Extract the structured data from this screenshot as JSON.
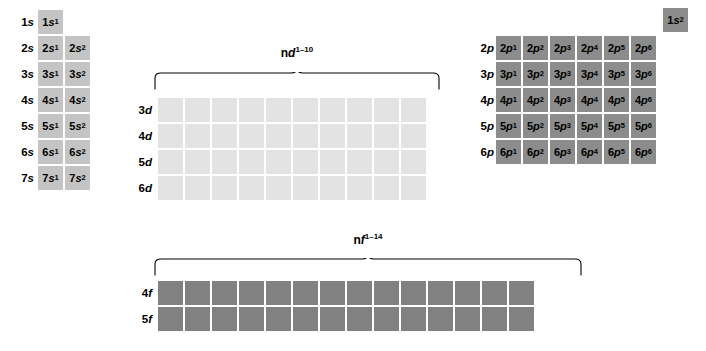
{
  "figure": {
    "colors": {
      "s_block": "#c3c4c3",
      "p_block": "#8b8c8b",
      "d_block": "#e2e3e2",
      "f_block": "#808180",
      "background": "#ffffff",
      "text": "#000000"
    }
  },
  "s_block": {
    "rows": [
      {
        "label_n": "1",
        "label_orbital": "s",
        "cells": [
          {
            "n": "1",
            "orbital": "s",
            "exp": "1"
          }
        ]
      },
      {
        "label_n": "2",
        "label_orbital": "s",
        "cells": [
          {
            "n": "2",
            "orbital": "s",
            "exp": "1"
          },
          {
            "n": "2",
            "orbital": "s",
            "exp": "2"
          }
        ]
      },
      {
        "label_n": "3",
        "label_orbital": "s",
        "cells": [
          {
            "n": "3",
            "orbital": "s",
            "exp": "1"
          },
          {
            "n": "3",
            "orbital": "s",
            "exp": "2"
          }
        ]
      },
      {
        "label_n": "4",
        "label_orbital": "s",
        "cells": [
          {
            "n": "4",
            "orbital": "s",
            "exp": "1"
          },
          {
            "n": "4",
            "orbital": "s",
            "exp": "2"
          }
        ]
      },
      {
        "label_n": "5",
        "label_orbital": "s",
        "cells": [
          {
            "n": "5",
            "orbital": "s",
            "exp": "1"
          },
          {
            "n": "5",
            "orbital": "s",
            "exp": "2"
          }
        ]
      },
      {
        "label_n": "6",
        "label_orbital": "s",
        "cells": [
          {
            "n": "6",
            "orbital": "s",
            "exp": "1"
          },
          {
            "n": "6",
            "orbital": "s",
            "exp": "2"
          }
        ]
      },
      {
        "label_n": "7",
        "label_orbital": "s",
        "cells": [
          {
            "n": "7",
            "orbital": "s",
            "exp": "1"
          },
          {
            "n": "7",
            "orbital": "s",
            "exp": "2"
          }
        ]
      }
    ]
  },
  "corner": {
    "cell": {
      "n": "1",
      "orbital": "s",
      "exp": "2"
    }
  },
  "p_block": {
    "rows": [
      {
        "label_n": "2",
        "label_orbital": "p",
        "cells": [
          {
            "n": "2",
            "orbital": "p",
            "exp": "1"
          },
          {
            "n": "2",
            "orbital": "p",
            "exp": "2"
          },
          {
            "n": "2",
            "orbital": "p",
            "exp": "3"
          },
          {
            "n": "2",
            "orbital": "p",
            "exp": "4"
          },
          {
            "n": "2",
            "orbital": "p",
            "exp": "5"
          },
          {
            "n": "2",
            "orbital": "p",
            "exp": "6"
          }
        ]
      },
      {
        "label_n": "3",
        "label_orbital": "p",
        "cells": [
          {
            "n": "3",
            "orbital": "p",
            "exp": "1"
          },
          {
            "n": "3",
            "orbital": "p",
            "exp": "2"
          },
          {
            "n": "3",
            "orbital": "p",
            "exp": "3"
          },
          {
            "n": "3",
            "orbital": "p",
            "exp": "4"
          },
          {
            "n": "3",
            "orbital": "p",
            "exp": "5"
          },
          {
            "n": "3",
            "orbital": "p",
            "exp": "6"
          }
        ]
      },
      {
        "label_n": "4",
        "label_orbital": "p",
        "cells": [
          {
            "n": "4",
            "orbital": "p",
            "exp": "1"
          },
          {
            "n": "4",
            "orbital": "p",
            "exp": "2"
          },
          {
            "n": "4",
            "orbital": "p",
            "exp": "3"
          },
          {
            "n": "4",
            "orbital": "p",
            "exp": "4"
          },
          {
            "n": "4",
            "orbital": "p",
            "exp": "5"
          },
          {
            "n": "4",
            "orbital": "p",
            "exp": "6"
          }
        ]
      },
      {
        "label_n": "5",
        "label_orbital": "p",
        "cells": [
          {
            "n": "5",
            "orbital": "p",
            "exp": "1"
          },
          {
            "n": "5",
            "orbital": "p",
            "exp": "2"
          },
          {
            "n": "5",
            "orbital": "p",
            "exp": "3"
          },
          {
            "n": "5",
            "orbital": "p",
            "exp": "4"
          },
          {
            "n": "5",
            "orbital": "p",
            "exp": "5"
          },
          {
            "n": "5",
            "orbital": "p",
            "exp": "6"
          }
        ]
      },
      {
        "label_n": "6",
        "label_orbital": "p",
        "cells": [
          {
            "n": "6",
            "orbital": "p",
            "exp": "1"
          },
          {
            "n": "6",
            "orbital": "p",
            "exp": "2"
          },
          {
            "n": "6",
            "orbital": "p",
            "exp": "3"
          },
          {
            "n": "6",
            "orbital": "p",
            "exp": "4"
          },
          {
            "n": "6",
            "orbital": "p",
            "exp": "5"
          },
          {
            "n": "6",
            "orbital": "p",
            "exp": "6"
          }
        ]
      }
    ]
  },
  "d_block": {
    "columns": 10,
    "caption": {
      "n_prefix": "n",
      "orbital": "d",
      "exp": "1–10"
    },
    "rows": [
      {
        "label_n": "3",
        "label_orbital": "d"
      },
      {
        "label_n": "4",
        "label_orbital": "d"
      },
      {
        "label_n": "5",
        "label_orbital": "d"
      },
      {
        "label_n": "6",
        "label_orbital": "d"
      }
    ]
  },
  "f_block": {
    "columns": 14,
    "caption": {
      "n_prefix": "n",
      "orbital": "f",
      "exp": "1–14"
    },
    "rows": [
      {
        "label_n": "4",
        "label_orbital": "f"
      },
      {
        "label_n": "5",
        "label_orbital": "f"
      }
    ]
  }
}
